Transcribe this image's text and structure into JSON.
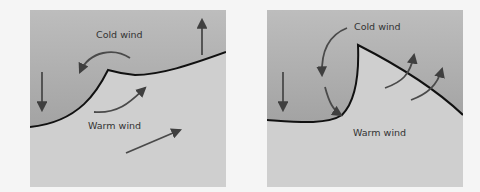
{
  "panels": [
    {
      "id": "left",
      "labels": {
        "cold": "Cold wind",
        "warm": "Warm wind"
      },
      "description": "Cold front undercutting warm air"
    },
    {
      "id": "right",
      "labels": {
        "cold": "Cold wind",
        "warm": "Warm wind"
      },
      "description": "Occluding front with warm air lifted over cold air"
    }
  ],
  "colors": {
    "page_bg": "#f5f5f5",
    "cold_air_top": "#b9b9b9",
    "cold_air_bottom": "#a5a5a5",
    "warm_air": "#cfcfcf",
    "front_line": "#111111",
    "arrow": "#4a4a4a",
    "text": "#333333"
  }
}
